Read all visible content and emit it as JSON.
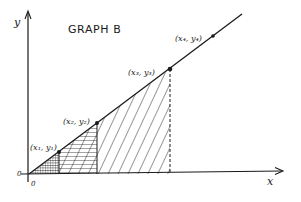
{
  "title": "GRAPH B",
  "axes": {
    "x_label": "x",
    "y_label": "y",
    "origin_x_label": "0",
    "origin_y_label": "0"
  },
  "points": [
    {
      "label": "(x₁, y₁)",
      "name": "point-1"
    },
    {
      "label": "(x₂, y₂)",
      "name": "point-2"
    },
    {
      "label": "(x₃, y₃)",
      "name": "point-3"
    },
    {
      "label": "(x₄, y₄)",
      "name": "point-4"
    }
  ],
  "regions": [
    {
      "name": "region-0-to-x1",
      "fill": "cross-hatch dense"
    },
    {
      "name": "region-x1-to-x2",
      "fill": "horizontal + diagonal hatch"
    },
    {
      "name": "region-x2-to-x3",
      "fill": "diagonal hatch"
    }
  ],
  "colors": {
    "ink": "#1a1a1a",
    "background": "#ffffff"
  }
}
